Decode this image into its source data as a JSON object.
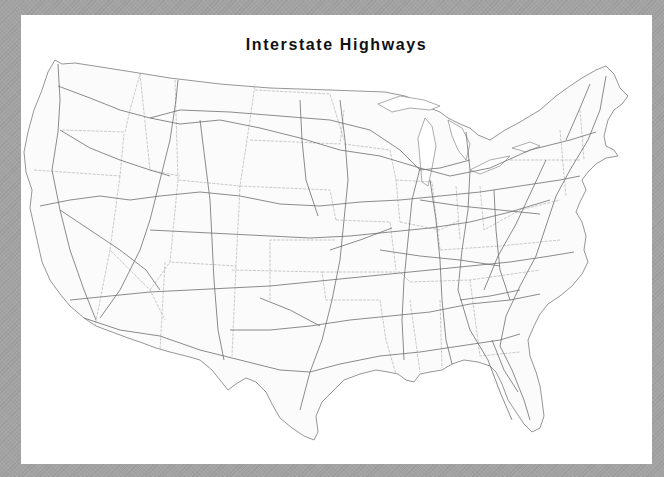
{
  "map": {
    "title": "Interstate Highways",
    "region": "Contiguous United States",
    "layers": [
      "state-boundaries",
      "interstate-highways",
      "coastline"
    ],
    "colors": {
      "frame": "#a3a3a3",
      "background": "#ffffff",
      "land": "#fbfbfb",
      "highway": "#6e6e6e",
      "state_border": "#a8a8a8"
    }
  }
}
